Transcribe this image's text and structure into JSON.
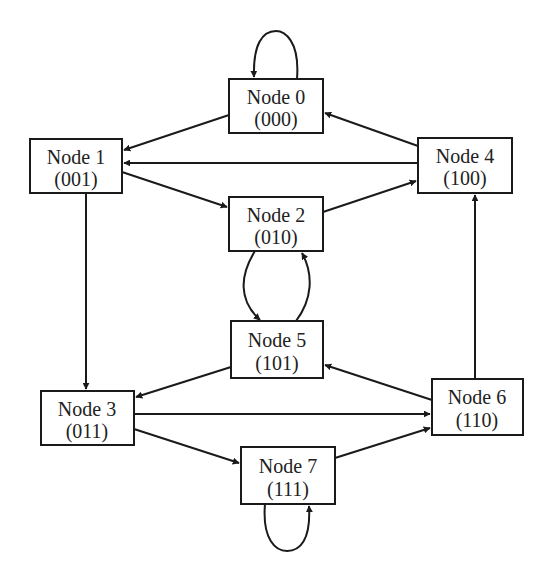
{
  "diagram": {
    "type": "state-transition-graph",
    "colors": {
      "stroke": "#1a1a1a",
      "text": "#222222",
      "background": "#ffffff"
    },
    "nodes": [
      {
        "id": 0,
        "name": "Node 0",
        "code": "(000)",
        "x": 229,
        "y": 79,
        "w": 94,
        "h": 54
      },
      {
        "id": 1,
        "name": "Node 1",
        "code": "(001)",
        "x": 30,
        "y": 139,
        "w": 92,
        "h": 54
      },
      {
        "id": 2,
        "name": "Node 2",
        "code": "(010)",
        "x": 229,
        "y": 197,
        "w": 94,
        "h": 54
      },
      {
        "id": 3,
        "name": "Node 3",
        "code": "(011)",
        "x": 41,
        "y": 391,
        "w": 93,
        "h": 54
      },
      {
        "id": 4,
        "name": "Node 4",
        "code": "(100)",
        "x": 418,
        "y": 138,
        "w": 94,
        "h": 55
      },
      {
        "id": 5,
        "name": "Node 5",
        "code": "(101)",
        "x": 231,
        "y": 321,
        "w": 92,
        "h": 57
      },
      {
        "id": 6,
        "name": "Node 6",
        "code": "(110)",
        "x": 432,
        "y": 379,
        "w": 91,
        "h": 56
      },
      {
        "id": 7,
        "name": "Node 7",
        "code": "(111)",
        "x": 241,
        "y": 447,
        "w": 94,
        "h": 57
      }
    ],
    "edges": [
      {
        "from": 0,
        "to": 0,
        "kind": "self-loop"
      },
      {
        "from": 0,
        "to": 1
      },
      {
        "from": 1,
        "to": 2
      },
      {
        "from": 1,
        "to": 3
      },
      {
        "from": 2,
        "to": 4
      },
      {
        "from": 2,
        "to": 5,
        "kind": "curved"
      },
      {
        "from": 3,
        "to": 6
      },
      {
        "from": 3,
        "to": 7
      },
      {
        "from": 4,
        "to": 0
      },
      {
        "from": 4,
        "to": 1
      },
      {
        "from": 5,
        "to": 2,
        "kind": "curved"
      },
      {
        "from": 5,
        "to": 3
      },
      {
        "from": 6,
        "to": 4
      },
      {
        "from": 6,
        "to": 5
      },
      {
        "from": 7,
        "to": 6
      },
      {
        "from": 7,
        "to": 7,
        "kind": "self-loop"
      }
    ]
  }
}
